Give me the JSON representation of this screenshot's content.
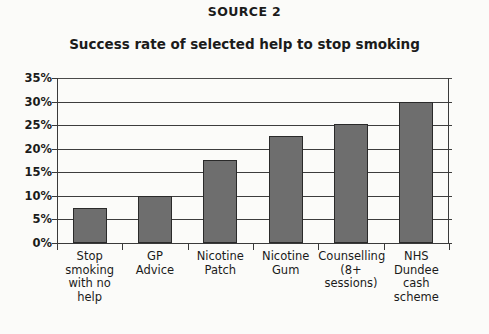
{
  "source_heading": "SOURCE 2",
  "chart_data": {
    "type": "bar",
    "title": "Success rate of selected help to stop smoking",
    "xlabel": "",
    "ylabel": "",
    "ylim": [
      0,
      35
    ],
    "grid": true,
    "legend": "none",
    "y_ticks": [
      "0%",
      "5%",
      "10%",
      "15%",
      "20%",
      "25%",
      "30%",
      "35%"
    ],
    "y_tick_values": [
      0,
      5,
      10,
      15,
      20,
      25,
      30,
      35
    ],
    "categories": [
      "Stop\nsmoking\nwith no\nhelp",
      "GP\nAdvice",
      "Nicotine\nPatch",
      "Nicotine\nGum",
      "Counselling\n(8+\nsessions)",
      "NHS\nDundee\ncash\nscheme"
    ],
    "values": [
      7.5,
      10,
      17.6,
      22.8,
      25.3,
      30
    ],
    "value_unit": "%",
    "bar_color": "#6e6e6e",
    "bar_edge_color": "#2a2a2a"
  }
}
